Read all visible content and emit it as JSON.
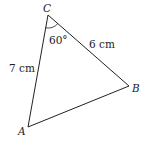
{
  "diagram": {
    "type": "triangle",
    "vertices": {
      "A": {
        "label": "A",
        "x": 28,
        "y": 127
      },
      "B": {
        "label": "B",
        "x": 129,
        "y": 86
      },
      "C": {
        "label": "C",
        "x": 48,
        "y": 15
      }
    },
    "sides": {
      "CA": {
        "label": "7 cm"
      },
      "CB": {
        "label": "6 cm"
      }
    },
    "angles": {
      "C": {
        "label": "60°"
      }
    },
    "colors": {
      "stroke": "#222222",
      "background": "#ffffff"
    }
  }
}
